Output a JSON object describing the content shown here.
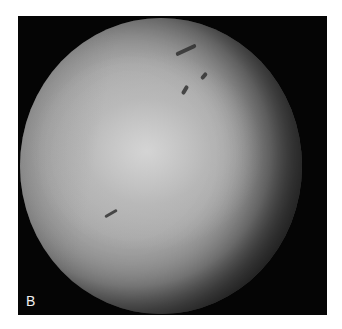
{
  "figure": {
    "panel_label": "B",
    "colors": {
      "background": "#ffffff",
      "frame": "#050505",
      "label": "#f0f0f0"
    }
  }
}
